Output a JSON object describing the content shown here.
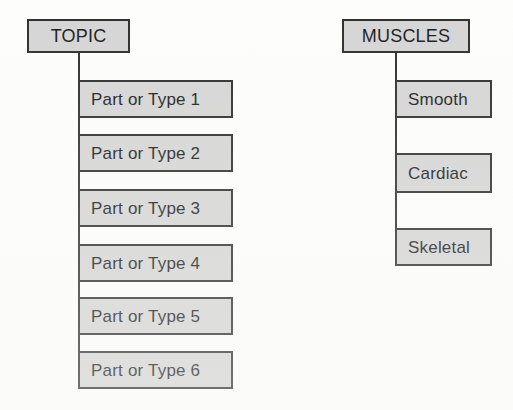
{
  "diagram": {
    "type": "concept-map",
    "background_color": "#fdfdfc",
    "node_fill_color": "#d5d5d5",
    "node_border_color": "#2e2e2e",
    "text_color": "#1c1c1c",
    "trees": [
      {
        "id": "generic-template",
        "root": {
          "label": "TOPIC",
          "x": 27,
          "y": 19,
          "w": 103,
          "h": 34
        },
        "connector": {
          "x": 78,
          "y_top": 53,
          "y_bottom": 371
        },
        "children": [
          {
            "label": "Part or Type 1",
            "x": 78,
            "y": 80,
            "w": 155,
            "h": 38
          },
          {
            "label": "Part or Type 2",
            "x": 78,
            "y": 134,
            "w": 155,
            "h": 38
          },
          {
            "label": "Part or Type 3",
            "x": 78,
            "y": 189,
            "w": 155,
            "h": 38
          },
          {
            "label": "Part or Type 4",
            "x": 78,
            "y": 244,
            "w": 155,
            "h": 38
          },
          {
            "label": "Part or Type 5",
            "x": 78,
            "y": 297,
            "w": 155,
            "h": 38
          },
          {
            "label": "Part or Type 6",
            "x": 78,
            "y": 351,
            "w": 155,
            "h": 38
          }
        ]
      },
      {
        "id": "muscles-example",
        "root": {
          "label": "MUSCLES",
          "x": 342,
          "y": 19,
          "w": 128,
          "h": 34
        },
        "connector": {
          "x": 395,
          "y_top": 53,
          "y_bottom": 266
        },
        "children": [
          {
            "label": "Smooth",
            "x": 395,
            "y": 80,
            "w": 97,
            "h": 38
          },
          {
            "label": "Cardiac",
            "x": 395,
            "y": 153,
            "w": 97,
            "h": 40
          },
          {
            "label": "Skeletal",
            "x": 395,
            "y": 228,
            "w": 97,
            "h": 38
          }
        ]
      }
    ]
  }
}
